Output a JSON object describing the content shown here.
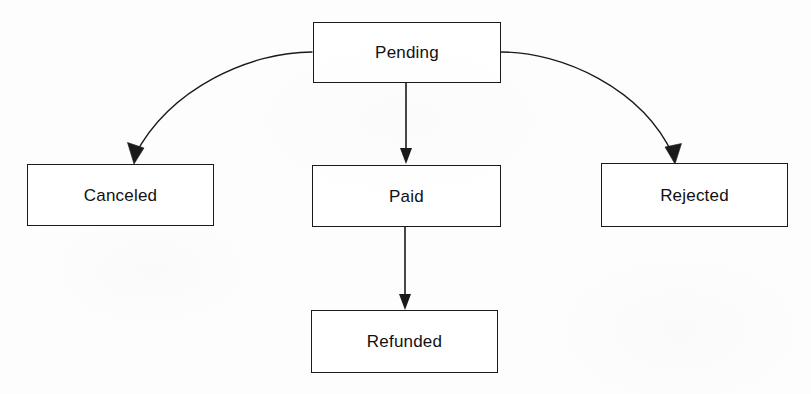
{
  "diagram": {
    "type": "state-flowchart",
    "title": "",
    "background_color": "#fdfdfd",
    "line_color": "#1a1a1a",
    "text_color": "#111111",
    "nodes": [
      {
        "id": "pending",
        "label": "Pending"
      },
      {
        "id": "canceled",
        "label": "Canceled"
      },
      {
        "id": "paid",
        "label": "Paid"
      },
      {
        "id": "rejected",
        "label": "Rejected"
      },
      {
        "id": "refunded",
        "label": "Refunded"
      }
    ],
    "edges": [
      {
        "id": "pending-to-canceled",
        "from": "Pending",
        "to": "Canceled",
        "label": "",
        "style": "curved-arrow"
      },
      {
        "id": "pending-to-paid",
        "from": "Pending",
        "to": "Paid",
        "label": "",
        "style": "straight-arrow"
      },
      {
        "id": "pending-to-rejected",
        "from": "Pending",
        "to": "Rejected",
        "label": "",
        "style": "curved-arrow"
      },
      {
        "id": "paid-to-refunded",
        "from": "Paid",
        "to": "Refunded",
        "label": "",
        "style": "straight-arrow"
      }
    ]
  }
}
